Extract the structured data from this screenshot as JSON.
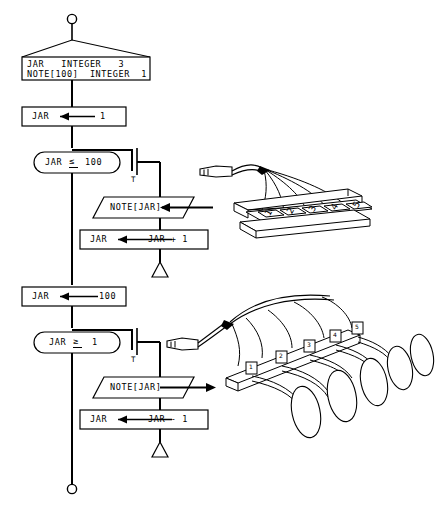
{
  "diagram": {
    "type": "structured-flowchart",
    "canvas": {
      "width": 444,
      "height": 512
    },
    "colors": {
      "stroke": "#000000",
      "background": "#ffffff",
      "text": "#000000"
    }
  },
  "terminals": {
    "start_label": "",
    "end_label": ""
  },
  "declaration": {
    "name": "variable-declaration-block",
    "lines": [
      "JAR   INTEGER   3",
      "NOTE[100]  INTEGER  1"
    ],
    "variables": [
      {
        "identifier": "JAR",
        "type": "INTEGER",
        "size": "3"
      },
      {
        "identifier": "NOTE[100]",
        "type": "INTEGER",
        "size": "1"
      }
    ]
  },
  "steps": {
    "init_up": {
      "label": "JAR       1",
      "target": "JAR",
      "operator": "←",
      "value": "1"
    },
    "cond_up": {
      "label": "JAR  ≤  100",
      "variable": "JAR",
      "operator": "≤",
      "operand": "100",
      "true_flag": "T"
    },
    "read_note": {
      "label": "NOTE[JAR]",
      "direction": "input"
    },
    "increment": {
      "label": "JAR        JAR + 1",
      "target": "JAR",
      "operator": "←",
      "expression": "JAR + 1"
    },
    "init_down": {
      "label": "JAR       100",
      "target": "JAR",
      "operator": "←",
      "value": "100"
    },
    "cond_down": {
      "label": "JAR  ≥  1",
      "variable": "JAR",
      "operator": "≥",
      "operand": "1",
      "true_flag": "T"
    },
    "write_note": {
      "label": "NOTE[JAR]",
      "direction": "output"
    },
    "decrement": {
      "label": "JAR        JAR - 1",
      "target": "JAR",
      "operator": "←",
      "expression": "JAR - 1"
    }
  },
  "illustrations": {
    "input_device": {
      "name": "numbered-key-rack",
      "caption": "",
      "slot_labels": [
        "1",
        "2",
        "3",
        "4",
        "5"
      ],
      "connector": "plug"
    },
    "output_device": {
      "name": "numbered-horn-array",
      "caption": "",
      "slot_labels": [
        "1",
        "2",
        "3",
        "4",
        "5"
      ],
      "connector": "plug"
    }
  }
}
